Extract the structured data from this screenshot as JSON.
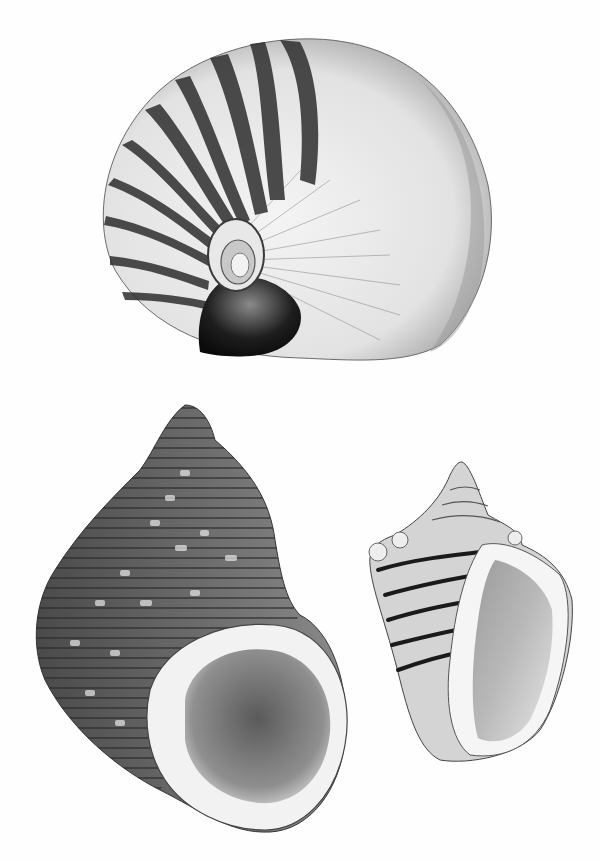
{
  "image": {
    "kind": "scientific lithograph illustration",
    "palette": {
      "background": "#fefefe",
      "ink_dark": "#1a1a1a",
      "ink_mid": "#5a5a5a",
      "ink_light": "#a8a8a8",
      "shell_pale": "#eeeeee"
    },
    "subjects": [
      {
        "id": "nautilus",
        "label": "Nautilus shell, side view, banded",
        "position": "top center"
      },
      {
        "id": "turban-snail",
        "label": "Turbinate snail shell, aperture view, ribbed and mottled",
        "position": "bottom left"
      },
      {
        "id": "conch",
        "label": "Conch / strombus shell, aperture view, dark spiral bands",
        "position": "bottom right"
      }
    ]
  }
}
